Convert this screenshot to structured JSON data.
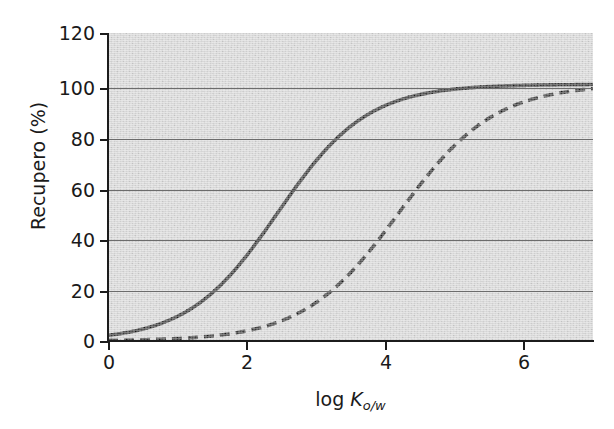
{
  "figure": {
    "width": 614,
    "height": 429,
    "background_color": "#ffffff",
    "plot_background_color": "#d4d4d4",
    "gridline_color": "#6c6c6c",
    "axis_color": "#1c1c1c",
    "curve_color": "#1a1a1a"
  },
  "axes": {
    "y_title": "Recupero (%)",
    "x_title_prefix": "log ",
    "x_title_symbol": "K",
    "x_title_subscript": "o/w",
    "y_ticks": [
      "120",
      "100",
      "80",
      "60",
      "40",
      "20",
      "0"
    ],
    "x_ticks": [
      "0",
      "2",
      "4",
      "6"
    ]
  },
  "chart_data": {
    "type": "line",
    "title": "",
    "xlabel": "log Ko/w",
    "ylabel": "Recupero (%)",
    "xlim": [
      0,
      7
    ],
    "ylim": [
      0,
      120
    ],
    "xticks": [
      0,
      2,
      4,
      6
    ],
    "yticks": [
      0,
      20,
      40,
      60,
      80,
      100,
      120
    ],
    "grid": "horizontal",
    "legend": "none",
    "x": [
      0.0,
      0.25,
      0.5,
      0.75,
      1.0,
      1.25,
      1.5,
      1.75,
      2.0,
      2.25,
      2.5,
      2.75,
      3.0,
      3.25,
      3.5,
      3.75,
      4.0,
      4.25,
      4.5,
      4.75,
      5.0,
      5.25,
      5.5,
      5.75,
      6.0,
      6.25,
      6.5,
      6.75,
      7.0
    ],
    "series": [
      {
        "name": "solid-curve",
        "style": "solid",
        "color": "#1a1a1a",
        "midpoint_x": 2.45,
        "slope": 1.55,
        "values": [
          0.9,
          1.3,
          1.9,
          2.8,
          4.1,
          5.9,
          8.5,
          12.1,
          17.0,
          23.3,
          31.0,
          39.8,
          49.2,
          58.6,
          67.4,
          75.1,
          81.5,
          86.6,
          90.4,
          93.2,
          95.3,
          96.8,
          97.8,
          98.5,
          99.0,
          99.4,
          99.6,
          99.8,
          100.0
        ]
      },
      {
        "name": "dashed-curve",
        "style": "dashed",
        "color": "#1a1a1a",
        "midpoint_x": 4.2,
        "slope": 1.45,
        "values": [
          0.2,
          0.3,
          0.4,
          0.6,
          0.8,
          1.1,
          1.6,
          2.2,
          3.1,
          4.4,
          6.2,
          8.6,
          11.9,
          16.2,
          21.6,
          28.1,
          35.5,
          43.5,
          51.7,
          59.7,
          67.1,
          73.6,
          79.2,
          83.8,
          87.5,
          90.5,
          92.9,
          94.7,
          96.1
        ]
      }
    ]
  }
}
